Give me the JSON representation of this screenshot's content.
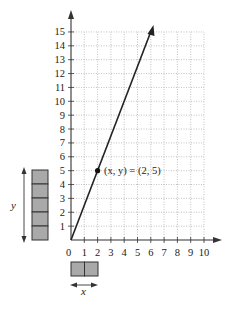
{
  "chart_data": {
    "type": "line",
    "title": "",
    "xlabel": "x",
    "ylabel": "y",
    "xlim": [
      0,
      10
    ],
    "ylim": [
      0,
      15
    ],
    "grid": true,
    "x_ticks": [
      "1",
      "2",
      "3",
      "4",
      "5",
      "6",
      "7",
      "8",
      "9",
      "10"
    ],
    "y_ticks": [
      "1",
      "2",
      "3",
      "4",
      "5",
      "6",
      "7",
      "8",
      "9",
      "10",
      "11",
      "12",
      "13",
      "14",
      "15"
    ],
    "origin_label": "0",
    "line": {
      "equation": "y = 2.5x",
      "x": [
        0,
        6.2
      ],
      "y": [
        0,
        15.5
      ]
    },
    "points": [
      {
        "x": 2,
        "y": 5,
        "label": "(x, y) = (2, 5)"
      }
    ],
    "blocks": {
      "y_blocks": 5,
      "x_blocks": 2,
      "y_label": "y",
      "x_label": "x"
    }
  },
  "annotation": {
    "point_label": "(x, y) = (2, 5)"
  },
  "labels": {
    "origin": "0",
    "x_var": "x",
    "y_var": "y"
  }
}
